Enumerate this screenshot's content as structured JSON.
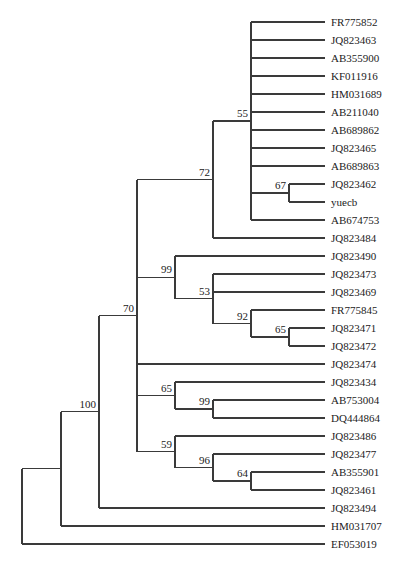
{
  "tree": {
    "support": 0,
    "children": [
      {
        "support": 100,
        "children": [
          {
            "support": 70,
            "children": [
              {
                "support": 72,
                "children": [
                  {
                    "support": 55,
                    "children": [
                      {
                        "name": "FR775852"
                      },
                      {
                        "name": "JQ823463"
                      },
                      {
                        "name": "AB355900"
                      },
                      {
                        "name": "KF011916"
                      },
                      {
                        "name": "HM031689"
                      },
                      {
                        "name": "AB211040"
                      },
                      {
                        "name": "AB689862"
                      },
                      {
                        "name": "JQ823465"
                      },
                      {
                        "name": "AB689863"
                      },
                      {
                        "support": 67,
                        "children": [
                          {
                            "name": "JQ823462"
                          },
                          {
                            "name": "yuecb"
                          }
                        ]
                      },
                      {
                        "name": "AB674753"
                      }
                    ]
                  },
                  {
                    "name": "JQ823484"
                  }
                ]
              },
              {
                "support": 99,
                "children": [
                  {
                    "name": "JQ823490"
                  },
                  {
                    "support": 53,
                    "children": [
                      {
                        "name": "JQ823473"
                      },
                      {
                        "name": "JQ823469"
                      },
                      {
                        "support": 92,
                        "children": [
                          {
                            "name": "FR775845"
                          },
                          {
                            "support": 65,
                            "children": [
                              {
                                "name": "JQ823471"
                              },
                              {
                                "name": "JQ823472"
                              }
                            ]
                          }
                        ]
                      }
                    ]
                  }
                ]
              },
              {
                "name": "JQ823474"
              },
              {
                "support": 65,
                "children": [
                  {
                    "name": "JQ823434"
                  },
                  {
                    "support": 99,
                    "children": [
                      {
                        "name": "AB753004"
                      },
                      {
                        "name": "DQ444864"
                      }
                    ]
                  }
                ]
              },
              {
                "support": 59,
                "children": [
                  {
                    "name": "JQ823486"
                  },
                  {
                    "support": 96,
                    "children": [
                      {
                        "name": "JQ823477"
                      },
                      {
                        "support": 64,
                        "children": [
                          {
                            "name": "AB355901"
                          },
                          {
                            "name": "JQ823461"
                          }
                        ]
                      }
                    ]
                  }
                ]
              }
            ]
          },
          {
            "name": "JQ823494"
          }
        ]
      },
      {
        "name": "HM031707"
      }
    ]
  },
  "outgroup": "EF053019"
}
